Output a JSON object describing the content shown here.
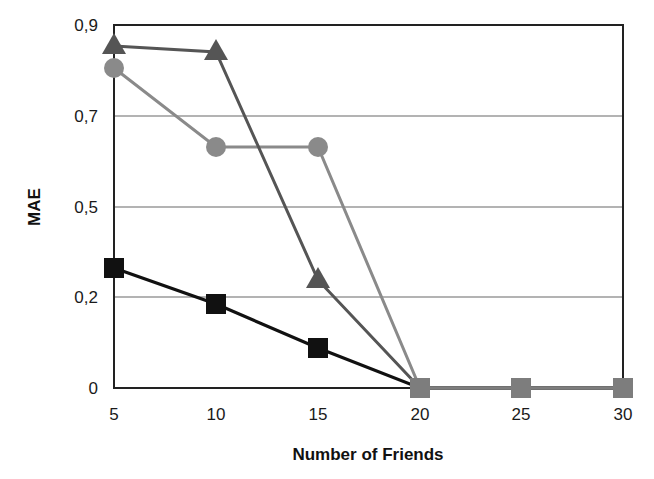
{
  "chart_data": {
    "type": "line",
    "title": "",
    "xlabel": "Number of Friends",
    "ylabel": "MAE",
    "x": [
      5,
      10,
      15,
      20,
      25,
      30
    ],
    "x_tick_labels": [
      "5",
      "10",
      "15",
      "20",
      "25",
      "30"
    ],
    "y_tick_labels": [
      "0",
      "0,2",
      "0,5",
      "0,7",
      "0,9"
    ],
    "y_tick_values": [
      0,
      0.2,
      0.5,
      0.7,
      0.9
    ],
    "ylim": [
      0,
      0.9
    ],
    "grid": "horizontal",
    "legend": "none",
    "series": [
      {
        "name": "triangle-series",
        "marker": "triangle",
        "color": "#555555",
        "values": [
          0.85,
          0.84,
          0.26,
          0,
          0,
          0
        ],
        "py": [
          46,
          52,
          280,
          388,
          388,
          388
        ]
      },
      {
        "name": "circle-series",
        "marker": "circle",
        "color": "#8a8a8a",
        "values": [
          0.81,
          0.63,
          0.63,
          0,
          0,
          0
        ],
        "py": [
          68,
          147,
          147,
          388,
          388,
          388
        ]
      },
      {
        "name": "square-series",
        "marker": "square",
        "color": "#111111",
        "values": [
          0.3,
          0.18,
          0.09,
          0,
          0,
          0
        ],
        "py": [
          268,
          304,
          348,
          388,
          388,
          388
        ]
      }
    ]
  },
  "layout": {
    "plot_left": 114,
    "plot_right": 623,
    "plot_top": 25,
    "plot_bottom": 388,
    "x_px": [
      114,
      216,
      318,
      420,
      521,
      623
    ],
    "y_tick_px": [
      388,
      297,
      207,
      116,
      25
    ]
  },
  "colors": {
    "frame": "#222222",
    "grid": "#9a9a9a",
    "zero_markers": "#7d7d7d"
  }
}
